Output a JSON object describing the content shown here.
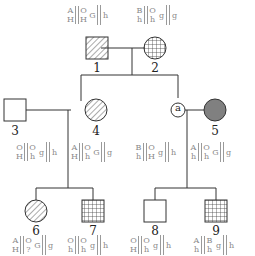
{
  "individuals": [
    {
      "id": "1",
      "label": "1",
      "sex": "male",
      "fill": "diagonal-hatch",
      "genotype": {
        "top": [
          "A",
          "O"
        ],
        "bottom": [
          "H",
          "H"
        ],
        "x_linked": [
          "G",
          "h"
        ]
      }
    },
    {
      "id": "2",
      "label": "2",
      "sex": "female",
      "fill": "grid-hatch",
      "genotype": {
        "top": [
          "B",
          "O"
        ],
        "bottom": [
          "h",
          "h"
        ],
        "x_linked": [
          "g",
          "g"
        ]
      }
    },
    {
      "id": "3",
      "label": "3",
      "sex": "male",
      "fill": "none",
      "genotype": {
        "top": [
          "O",
          "O"
        ],
        "bottom": [
          "H",
          "h"
        ],
        "x_linked": [
          "g",
          "h"
        ]
      }
    },
    {
      "id": "4",
      "label": "4",
      "sex": "female",
      "fill": "diagonal-hatch",
      "genotype": {
        "top": [
          "A",
          "O"
        ],
        "bottom": [
          "H",
          "h"
        ],
        "x_linked": [
          "G",
          "g"
        ]
      }
    },
    {
      "id": "a",
      "label": "a",
      "sex": "unknown",
      "fill": "none",
      "genotype": {
        "top": [
          "B",
          "O"
        ],
        "bottom": [
          "h",
          "H"
        ],
        "x_linked": [
          "g",
          "h"
        ]
      }
    },
    {
      "id": "5",
      "label": "5",
      "sex": "female",
      "fill": "solid-gray",
      "genotype": {
        "top": [
          "A",
          "O"
        ],
        "bottom": [
          "h",
          "h"
        ],
        "x_linked": [
          "G",
          "g"
        ]
      }
    },
    {
      "id": "6",
      "label": "6",
      "sex": "female",
      "fill": "diagonal-hatch",
      "genotype": {
        "top": [
          "A",
          "O"
        ],
        "bottom": [
          "H",
          "?"
        ],
        "x_linked": [
          "G",
          "g"
        ]
      }
    },
    {
      "id": "7",
      "label": "7",
      "sex": "male",
      "fill": "grid-hatch",
      "genotype": {
        "top": [
          "O",
          "O"
        ],
        "bottom": [
          "h",
          "h"
        ],
        "x_linked": [
          "g",
          "h"
        ]
      }
    },
    {
      "id": "8",
      "label": "8",
      "sex": "male",
      "fill": "none",
      "genotype": {
        "top": [
          "O",
          "O"
        ],
        "bottom": [
          "H",
          "h"
        ],
        "x_linked": [
          "g",
          "h"
        ]
      }
    },
    {
      "id": "9",
      "label": "9",
      "sex": "male",
      "fill": "grid-hatch",
      "genotype": {
        "top": [
          "A",
          "B"
        ],
        "bottom": [
          "h",
          "h"
        ],
        "x_linked": [
          "g",
          "h"
        ]
      }
    }
  ],
  "colors": {
    "line": "#333333",
    "affected_solid": "#808080",
    "genotype_text": "#8a8a8a"
  }
}
